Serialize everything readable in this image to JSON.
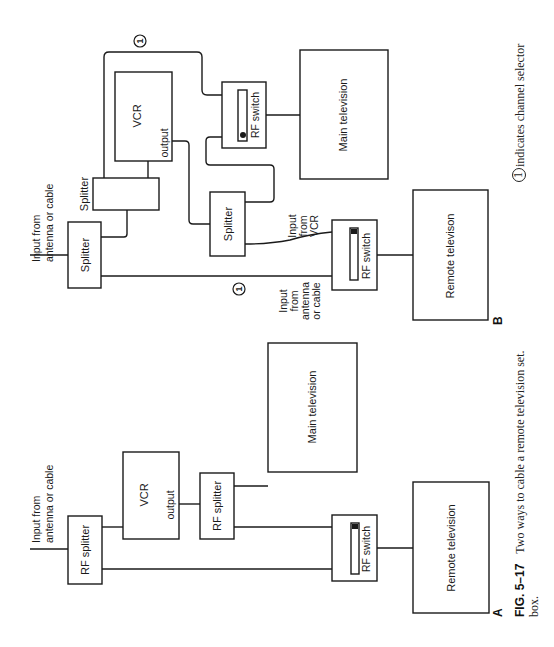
{
  "figure": {
    "number": "FIG. 5–17",
    "caption_line1": "Two ways to cable a remote television set.",
    "caption_selector_symbol": "1",
    "caption_line1_tail": "indicates channel selector",
    "caption_line2": "box."
  },
  "diagram_a": {
    "label": "A",
    "input_label_line1": "Input from",
    "input_label_line2": "antenna or cable",
    "rf_splitter_1": "RF splitter",
    "vcr": "VCR",
    "vcr_output": "output",
    "rf_splitter_2": "RF splitter",
    "main_tv": "Main television",
    "rf_switch": "RF switch",
    "remote_tv": "Remote television"
  },
  "diagram_b": {
    "label": "B",
    "input_label_line1": "Input from",
    "input_label_line2": "antenna or cable",
    "splitter_1": "Splitter",
    "splitter_2": "Splitter",
    "vcr": "VCR",
    "vcr_output": "output",
    "splitter_3": "Splitter",
    "rf_switch_main": "RF switch",
    "main_tv": "Main television",
    "selector_symbol": "1",
    "input_from_vcr_1": "Input",
    "input_from_vcr_2": "from",
    "input_from_vcr_3": "VCR",
    "input_ant_1": "Input",
    "input_ant_2": "from",
    "input_ant_3": "antenna",
    "input_ant_4": "or cable",
    "rf_switch_remote": "RF switch",
    "remote_tv": "Remote televison"
  }
}
